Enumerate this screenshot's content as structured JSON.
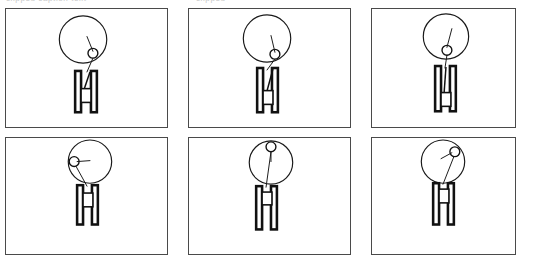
{
  "image": {
    "kind": "sketch-frame-grid",
    "width": 534,
    "height": 268,
    "background_color": "#ffffff",
    "ink_color": "#1a1a1a",
    "panel_border_color": "#4a4a4a",
    "rows": 2,
    "columns": 3,
    "panel_count": 6
  },
  "caption": {
    "line_one": "clipped caption text",
    "line_two": "clipped",
    "visible": "partially cut off at top edge",
    "color": "#c9c9c9"
  },
  "panels": [
    {
      "index": 1,
      "position": "top-left",
      "label": "frame-1",
      "big_circle": {
        "cx": 82,
        "cy": 38,
        "r": 24
      },
      "small_circle": {
        "cx": 92,
        "cy": 52,
        "r": 5,
        "location": "lower-right inside big circle"
      },
      "spoke": {
        "x1": 86,
        "y1": 35,
        "x2": 92,
        "y2": 50
      },
      "tether": {
        "x1": 92,
        "y1": 57,
        "x2": 86,
        "y2": 71
      },
      "base": {
        "left_bar": {
          "x": 74,
          "y": 70,
          "w": 6,
          "h": 42
        },
        "right_bar": {
          "x": 90,
          "y": 70,
          "w": 6,
          "h": 42
        },
        "crossbar": {
          "x": 80,
          "y": 88,
          "w": 10,
          "h": 14
        },
        "diagonal": {
          "x1": 88,
          "y1": 71,
          "x2": 82,
          "y2": 92
        }
      }
    },
    {
      "index": 2,
      "position": "top-middle",
      "label": "frame-2",
      "big_circle": {
        "cx": 266,
        "cy": 38,
        "r": 24
      },
      "small_circle": {
        "cx": 274,
        "cy": 54,
        "r": 5,
        "location": "bottom-right inside big circle"
      },
      "spoke": {
        "x1": 270,
        "y1": 35,
        "x2": 274,
        "y2": 52
      },
      "tether": {
        "x1": 274,
        "y1": 59,
        "x2": 266,
        "y2": 70
      },
      "base": {
        "left_bar": {
          "x": 256,
          "y": 68,
          "w": 6,
          "h": 45
        },
        "right_bar": {
          "x": 271,
          "y": 68,
          "w": 6,
          "h": 45
        },
        "crossbar": {
          "x": 262,
          "y": 91,
          "w": 10,
          "h": 14
        },
        "diagonal": {
          "x1": 272,
          "y1": 69,
          "x2": 265,
          "y2": 95
        }
      }
    },
    {
      "index": 3,
      "position": "top-right",
      "label": "frame-3",
      "big_circle": {
        "cx": 446,
        "cy": 36,
        "r": 23
      },
      "small_circle": {
        "cx": 447,
        "cy": 50,
        "r": 5,
        "location": "bottom-center inside big circle"
      },
      "spoke": {
        "x1": 452,
        "y1": 28,
        "x2": 447,
        "y2": 47
      },
      "tether": {
        "x1": 447,
        "y1": 55,
        "x2": 445,
        "y2": 68
      },
      "base": {
        "left_bar": {
          "x": 435,
          "y": 66,
          "w": 6,
          "h": 46
        },
        "right_bar": {
          "x": 450,
          "y": 66,
          "w": 6,
          "h": 46
        },
        "crossbar": {
          "x": 441,
          "y": 93,
          "w": 10,
          "h": 14
        },
        "diagonal": {
          "x1": 446,
          "y1": 67,
          "x2": 444,
          "y2": 95
        }
      }
    },
    {
      "index": 4,
      "position": "bottom-left",
      "label": "frame-4",
      "big_circle": {
        "cx": 89,
        "cy": 160,
        "r": 22
      },
      "small_circle": {
        "cx": 73,
        "cy": 160,
        "r": 5,
        "location": "left edge inside big circle"
      },
      "spoke": {
        "x1": 89,
        "y1": 159,
        "x2": 76,
        "y2": 160
      },
      "tether": {
        "x1": 75,
        "y1": 165,
        "x2": 86,
        "y2": 185
      },
      "base": {
        "left_bar": {
          "x": 76,
          "y": 184,
          "w": 6,
          "h": 40
        },
        "right_bar": {
          "x": 91,
          "y": 184,
          "w": 6,
          "h": 40
        },
        "crossbar": {
          "x": 82,
          "y": 192,
          "w": 10,
          "h": 14
        },
        "diagonal": null
      }
    },
    {
      "index": 5,
      "position": "bottom-middle",
      "label": "frame-5",
      "big_circle": {
        "cx": 271,
        "cy": 161,
        "r": 22
      },
      "small_circle": {
        "cx": 271,
        "cy": 145,
        "r": 5,
        "location": "top-center inside big circle"
      },
      "spoke": {
        "x1": 271,
        "y1": 150,
        "x2": 271,
        "y2": 160
      },
      "tether": {
        "x1": 271,
        "y1": 150,
        "x2": 266,
        "y2": 186
      },
      "base": {
        "left_bar": {
          "x": 256,
          "y": 185,
          "w": 6,
          "h": 44
        },
        "right_bar": {
          "x": 271,
          "y": 185,
          "w": 6,
          "h": 44
        },
        "crossbar": {
          "x": 262,
          "y": 191,
          "w": 10,
          "h": 13
        },
        "diagonal": null
      }
    },
    {
      "index": 6,
      "position": "bottom-right",
      "label": "frame-6",
      "big_circle": {
        "cx": 443,
        "cy": 160,
        "r": 22
      },
      "small_circle": {
        "cx": 455,
        "cy": 150,
        "r": 5,
        "location": "upper-right inside big circle"
      },
      "spoke": {
        "x1": 441,
        "y1": 157,
        "x2": 452,
        "y2": 151
      },
      "tether": {
        "x1": 454,
        "y1": 155,
        "x2": 443,
        "y2": 183
      },
      "base": {
        "left_bar": {
          "x": 433,
          "y": 182,
          "w": 6,
          "h": 42
        },
        "right_bar": {
          "x": 448,
          "y": 182,
          "w": 6,
          "h": 42
        },
        "crossbar": {
          "x": 439,
          "y": 188,
          "w": 10,
          "h": 14
        },
        "diagonal": null
      }
    }
  ]
}
